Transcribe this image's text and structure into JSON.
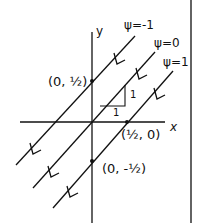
{
  "diagram": {
    "axes": {
      "x_label": "x",
      "y_label": "y"
    },
    "streamlines": [
      {
        "label": "ψ=-1"
      },
      {
        "label": "ψ=0"
      },
      {
        "label": "ψ=1"
      }
    ],
    "points": [
      {
        "label": "(0, ½)"
      },
      {
        "label": "(½, 0)"
      },
      {
        "label": "(0, -½)"
      }
    ],
    "slope_triangle": {
      "rise": "1",
      "run": "1"
    },
    "colors": {
      "ink": "#111111",
      "background": "#ffffff"
    }
  }
}
